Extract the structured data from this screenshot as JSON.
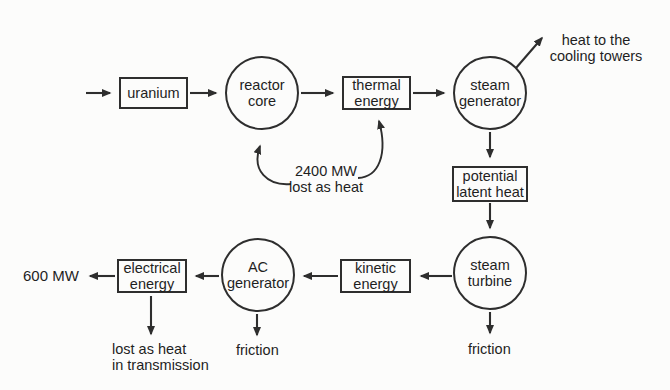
{
  "diagram_title": "nuclear power plant energy flow",
  "colors": {
    "line": "#2e2e2e",
    "text": "#1f1f1f",
    "background": "#fcfcfb"
  },
  "nodes": {
    "uranium": {
      "label": "uranium",
      "shape": "rect"
    },
    "reactor_core": {
      "label": "reactor\ncore",
      "shape": "circle"
    },
    "thermal_energy": {
      "label": "thermal\nenergy",
      "shape": "rect"
    },
    "steam_generator": {
      "label": "steam\ngenerator",
      "shape": "circle"
    },
    "potential_latent_heat": {
      "label": "potential\nlatent heat",
      "shape": "rect"
    },
    "steam_turbine": {
      "label": "steam\nturbine",
      "shape": "circle"
    },
    "kinetic_energy": {
      "label": "kinetic\nenergy",
      "shape": "rect"
    },
    "ac_generator": {
      "label": "AC\ngenerator",
      "shape": "circle"
    },
    "electrical_energy": {
      "label": "electrical\nenergy",
      "shape": "rect"
    }
  },
  "annotations": {
    "heat_to_cooling_towers": "heat to the\ncooling towers",
    "lost_as_heat_2400": "2400 MW\nlost as heat",
    "output_600mw": "600 MW",
    "lost_in_transmission": "lost as heat\nin transmission",
    "friction_generator": "friction",
    "friction_turbine": "friction"
  }
}
